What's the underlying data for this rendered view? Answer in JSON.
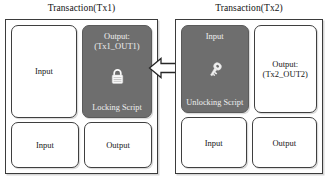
{
  "diagram": {
    "type": "transaction-locking-unlocking-script",
    "transactions": [
      {
        "id": "tx1",
        "title": "Transaction(Tx1)",
        "cells": [
          {
            "name": "input-top-left",
            "label": "Input",
            "style": "light",
            "icon": null
          },
          {
            "name": "output-locking",
            "label": "Output:\n(Tx1_OUT1)",
            "style": "dark",
            "icon": "lock-icon",
            "caption": "Locking Script"
          },
          {
            "name": "input-bottom-left",
            "label": "Input",
            "style": "light",
            "icon": null
          },
          {
            "name": "output-bottom-right",
            "label": "Output",
            "style": "light",
            "icon": null
          }
        ]
      },
      {
        "id": "tx2",
        "title": "Transaction(Tx2)",
        "cells": [
          {
            "name": "input-unlocking",
            "label": "Input",
            "style": "dark",
            "icon": "key-icon",
            "caption": "Unlocking Script"
          },
          {
            "name": "output-top-right",
            "label": "Output:\n(Tx2_OUT2)",
            "style": "light",
            "icon": null
          },
          {
            "name": "input-bottom-left",
            "label": "Input",
            "style": "light",
            "icon": null
          },
          {
            "name": "output-bottom-right",
            "label": "Output",
            "style": "light",
            "icon": null
          }
        ]
      }
    ],
    "connector": {
      "name": "spend-arrow",
      "icon": "arrow-left-icon",
      "direction": "right-to-left",
      "from": "tx2-input-unlocking",
      "to": "tx1-output-locking",
      "label": ""
    },
    "colors": {
      "dark_cell": "#6e6e6e",
      "light_cell": "#ffffff",
      "border": "#3f3f3f",
      "text": "#161616",
      "dark_cell_text": "#f0f0f0",
      "background": "#ffffff"
    }
  }
}
